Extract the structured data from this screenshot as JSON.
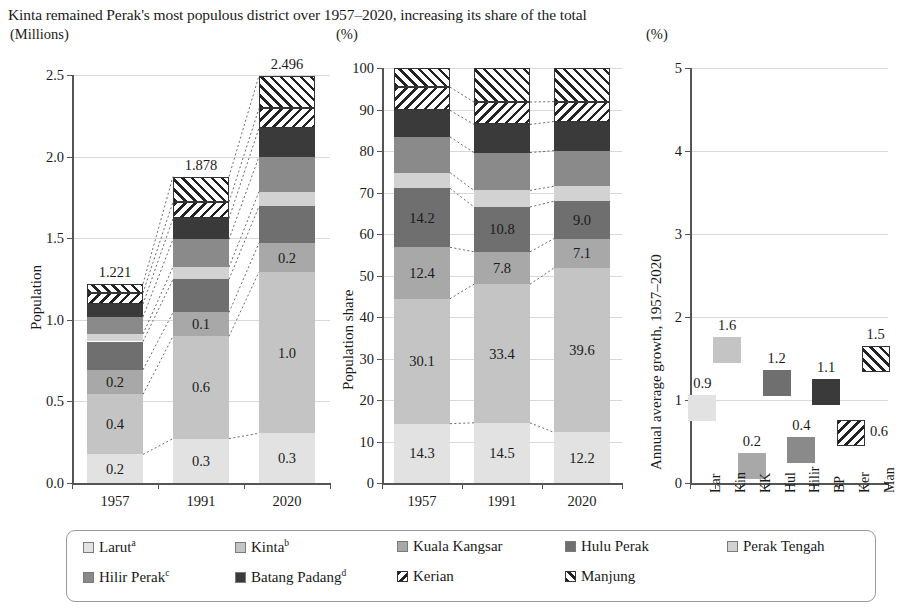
{
  "title": "Kinta remained Perak's most populous district over 1957–2020, increasing its share of the total",
  "units": {
    "left": "(Millions)",
    "mid": "(%)",
    "right": "(%)"
  },
  "colors": {
    "larut": "#e2e2e2",
    "kinta": "#c4c4c4",
    "kuala_kangsar": "#a8a8a8",
    "hulu_perak": "#6f6f6f",
    "perak_tengah": "#d2d2d2",
    "hilir_perak": "#8a8a8a",
    "batang_padang": "#3a3a3a",
    "kerian": "#ffffff",
    "manjung": "#ffffff",
    "grid": "#d9d9d9",
    "axis": "#555555"
  },
  "legend": {
    "items": [
      {
        "label": "Larut",
        "sup": "a",
        "key": "larut",
        "pattern": "solid"
      },
      {
        "label": "Kinta",
        "sup": "b",
        "key": "kinta",
        "pattern": "solid"
      },
      {
        "label": "Kuala Kangsar",
        "sup": "",
        "key": "kuala_kangsar",
        "pattern": "solid"
      },
      {
        "label": "Hulu Perak",
        "sup": "",
        "key": "hulu_perak",
        "pattern": "solid"
      },
      {
        "label": "Perak Tengah",
        "sup": "",
        "key": "perak_tengah",
        "pattern": "solid"
      },
      {
        "label": "Hilir Perak",
        "sup": "c",
        "key": "hilir_perak",
        "pattern": "solid"
      },
      {
        "label": "Batang Padang",
        "sup": "d",
        "key": "batang_padang",
        "pattern": "solid"
      },
      {
        "label": "Kerian",
        "sup": "",
        "key": "kerian",
        "pattern": "backslash"
      },
      {
        "label": "Manjung",
        "sup": "",
        "key": "manjung",
        "pattern": "forwardslash"
      }
    ]
  },
  "chart_data": [
    {
      "type": "bar",
      "id": "population",
      "title": "",
      "ylabel": "Population",
      "unit": "(Millions)",
      "xlabel": "",
      "categories": [
        "1957",
        "1991",
        "2020"
      ],
      "ylim": [
        0,
        2.5
      ],
      "yticks": [
        "0.0",
        "0.5",
        "1.0",
        "1.5",
        "2.0",
        "2.5"
      ],
      "grid": true,
      "stacked": true,
      "totals": [
        "1.221",
        "1.878",
        "2.496"
      ],
      "series": [
        {
          "name": "Larut",
          "key": "larut",
          "values": [
            0.175,
            0.272,
            0.305
          ],
          "labels": [
            "0.2",
            "0.3",
            "0.3"
          ]
        },
        {
          "name": "Kinta",
          "key": "kinta",
          "values": [
            0.368,
            0.627,
            0.988
          ],
          "labels": [
            "0.4",
            "0.6",
            "1.0"
          ]
        },
        {
          "name": "Kuala Kangsar",
          "key": "kuala_kangsar",
          "values": [
            0.151,
            0.146,
            0.177
          ],
          "labels": [
            "0.2",
            "0.1",
            "0.2"
          ]
        },
        {
          "name": "Hulu Perak",
          "key": "hulu_perak",
          "values": [
            0.173,
            0.203,
            0.225
          ],
          "labels": [
            "",
            "",
            ""
          ]
        },
        {
          "name": "Perak Tengah",
          "key": "perak_tengah",
          "values": [
            0.046,
            0.075,
            0.09
          ],
          "labels": [
            "",
            "",
            ""
          ]
        },
        {
          "name": "Hilir Perak",
          "key": "hilir_perak",
          "values": [
            0.105,
            0.17,
            0.215
          ],
          "labels": [
            "",
            "",
            ""
          ]
        },
        {
          "name": "Batang Padang",
          "key": "batang_padang",
          "values": [
            0.078,
            0.128,
            0.175
          ],
          "labels": [
            "",
            "",
            ""
          ]
        },
        {
          "name": "Kerian",
          "key": "kerian",
          "values": [
            0.069,
            0.102,
            0.12
          ],
          "labels": [
            "",
            "",
            ""
          ]
        },
        {
          "name": "Manjung",
          "key": "manjung",
          "values": [
            0.056,
            0.155,
            0.201
          ],
          "labels": [
            "",
            "",
            ""
          ]
        }
      ]
    },
    {
      "type": "bar",
      "id": "population-share",
      "title": "",
      "ylabel": "Population share",
      "unit": "(%)",
      "xlabel": "",
      "categories": [
        "1957",
        "1991",
        "2020"
      ],
      "ylim": [
        0,
        100
      ],
      "yticks": [
        "0",
        "10",
        "20",
        "30",
        "40",
        "50",
        "60",
        "70",
        "80",
        "90",
        "100"
      ],
      "grid": true,
      "stacked": true,
      "series": [
        {
          "name": "Larut",
          "key": "larut",
          "values": [
            14.3,
            14.5,
            12.2
          ],
          "labels": [
            "14.3",
            "14.5",
            "12.2"
          ]
        },
        {
          "name": "Kinta",
          "key": "kinta",
          "values": [
            30.1,
            33.4,
            39.6
          ],
          "labels": [
            "30.1",
            "33.4",
            "39.6"
          ]
        },
        {
          "name": "Kuala Kangsar",
          "key": "kuala_kangsar",
          "values": [
            12.4,
            7.8,
            7.1
          ],
          "labels": [
            "12.4",
            "7.8",
            "7.1"
          ]
        },
        {
          "name": "Hulu Perak",
          "key": "hulu_perak",
          "values": [
            14.2,
            10.8,
            9.0
          ],
          "labels": [
            "14.2",
            "10.8",
            "9.0"
          ]
        },
        {
          "name": "Perak Tengah",
          "key": "perak_tengah",
          "values": [
            3.8,
            4.0,
            3.6
          ],
          "labels": [
            "",
            "",
            ""
          ]
        },
        {
          "name": "Hilir Perak",
          "key": "hilir_perak",
          "values": [
            8.6,
            9.1,
            8.6
          ],
          "labels": [
            "",
            "",
            ""
          ]
        },
        {
          "name": "Batang Padang",
          "key": "batang_padang",
          "values": [
            6.4,
            6.8,
            7.0
          ],
          "labels": [
            "",
            "",
            ""
          ]
        },
        {
          "name": "Kerian",
          "key": "kerian",
          "values": [
            5.6,
            5.4,
            4.8
          ],
          "labels": [
            "",
            "",
            ""
          ]
        },
        {
          "name": "Manjung",
          "key": "manjung",
          "values": [
            4.6,
            8.2,
            8.1
          ],
          "labels": [
            "",
            "",
            ""
          ]
        }
      ]
    },
    {
      "type": "scatter",
      "id": "annual-growth",
      "title": "",
      "ylabel": "Annual average growth, 1957–2020",
      "unit": "(%)",
      "xlabel": "",
      "categories": [
        "Lar",
        "Kin",
        "KK",
        "Hul",
        "Hilir",
        "BP",
        "Ker",
        "Man"
      ],
      "ylim": [
        0,
        5
      ],
      "yticks": [
        "0",
        "1",
        "2",
        "3",
        "4",
        "5"
      ],
      "grid": true,
      "points": [
        {
          "x": "Lar",
          "key": "larut",
          "value": 0.9,
          "label": "0.9",
          "label_pos": "above",
          "pattern": "solid"
        },
        {
          "x": "Kin",
          "key": "kinta",
          "value": 1.6,
          "label": "1.6",
          "label_pos": "above",
          "pattern": "solid"
        },
        {
          "x": "KK",
          "key": "kuala_kangsar",
          "value": 0.2,
          "label": "0.2",
          "label_pos": "above",
          "pattern": "solid"
        },
        {
          "x": "Hul",
          "key": "hulu_perak",
          "value": 1.2,
          "label": "1.2",
          "label_pos": "above",
          "pattern": "solid"
        },
        {
          "x": "Hilir",
          "key": "hilir_perak",
          "value": 0.4,
          "label": "0.4",
          "label_pos": "above",
          "pattern": "solid"
        },
        {
          "x": "BP",
          "key": "batang_padang",
          "value": 1.1,
          "label": "1.1",
          "label_pos": "above",
          "pattern": "solid"
        },
        {
          "x": "Ker",
          "key": "kerian",
          "value": 0.6,
          "label": "0.6",
          "label_pos": "right",
          "pattern": "backslash"
        },
        {
          "x": "Man",
          "key": "manjung",
          "value": 1.5,
          "label": "1.5",
          "label_pos": "above",
          "pattern": "forwardslash"
        }
      ]
    }
  ]
}
